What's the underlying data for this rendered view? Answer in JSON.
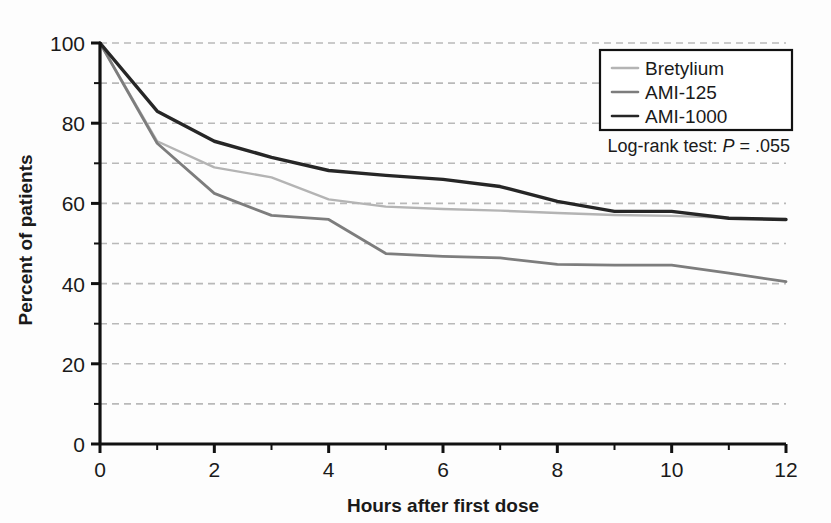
{
  "chart_data": {
    "type": "line",
    "title": "",
    "xlabel": "Hours after first dose",
    "ylabel": "Percent of patients",
    "xlim": [
      0,
      12
    ],
    "ylim": [
      0,
      100
    ],
    "xticks": [
      0,
      2,
      4,
      6,
      8,
      10,
      12
    ],
    "xticklabels": [
      "0",
      "2",
      "4",
      "6",
      "8",
      "10",
      "12"
    ],
    "xminorticks": [
      1,
      3,
      5,
      7,
      9,
      11
    ],
    "yticks": [
      0,
      20,
      40,
      60,
      80,
      100
    ],
    "yticklabels": [
      "0",
      "20",
      "40",
      "60",
      "80",
      "100"
    ],
    "yminorticks": [
      10,
      30,
      50,
      70,
      90
    ],
    "grid": "horizontal-dashed",
    "legend_position": "top-right",
    "annotation": {
      "prefix": "Log-rank test: ",
      "statistic": "P",
      "suffix": " = .055"
    },
    "series": [
      {
        "name": "Bretylium",
        "color": "#b4b4b4",
        "width": 2.4,
        "x": [
          0,
          1,
          2,
          3,
          4,
          5,
          6,
          7,
          8,
          9,
          10,
          11,
          12
        ],
        "y": [
          100,
          75.5,
          69.0,
          66.5,
          61.0,
          59.2,
          58.6,
          58.2,
          57.6,
          57.1,
          56.9,
          56.4,
          56.0
        ]
      },
      {
        "name": "AMI-125",
        "color": "#7d7d7d",
        "width": 2.8,
        "x": [
          0,
          1,
          2,
          3,
          4,
          5,
          6,
          7,
          8,
          9,
          10,
          11,
          12
        ],
        "y": [
          100,
          75.0,
          62.5,
          57.0,
          56.0,
          47.5,
          46.8,
          46.4,
          44.8,
          44.6,
          44.6,
          42.6,
          40.5
        ]
      },
      {
        "name": "AMI-1000",
        "color": "#262626",
        "width": 3.4,
        "x": [
          0,
          1,
          2,
          3,
          4,
          5,
          6,
          7,
          8,
          9,
          10,
          11,
          12
        ],
        "y": [
          100,
          83.0,
          75.5,
          71.5,
          68.2,
          67.0,
          66.0,
          64.2,
          60.5,
          58.0,
          58.0,
          56.3,
          56.0
        ]
      }
    ]
  },
  "axes": {
    "xlabel": "Hours after first dose",
    "ylabel": "Percent of patients"
  },
  "legend": {
    "items": [
      {
        "label": "Bretylium",
        "color": "#b4b4b4"
      },
      {
        "label": "AMI-125",
        "color": "#7d7d7d"
      },
      {
        "label": "AMI-1000",
        "color": "#262626"
      }
    ]
  },
  "annotation": {
    "prefix": "Log-rank test: ",
    "statistic": "P",
    "suffix": " = .055"
  },
  "colors": {
    "axis": "#111111",
    "grid": "#b9b9b9",
    "background": "#fdfdfd",
    "text": "#1a1a1a"
  }
}
